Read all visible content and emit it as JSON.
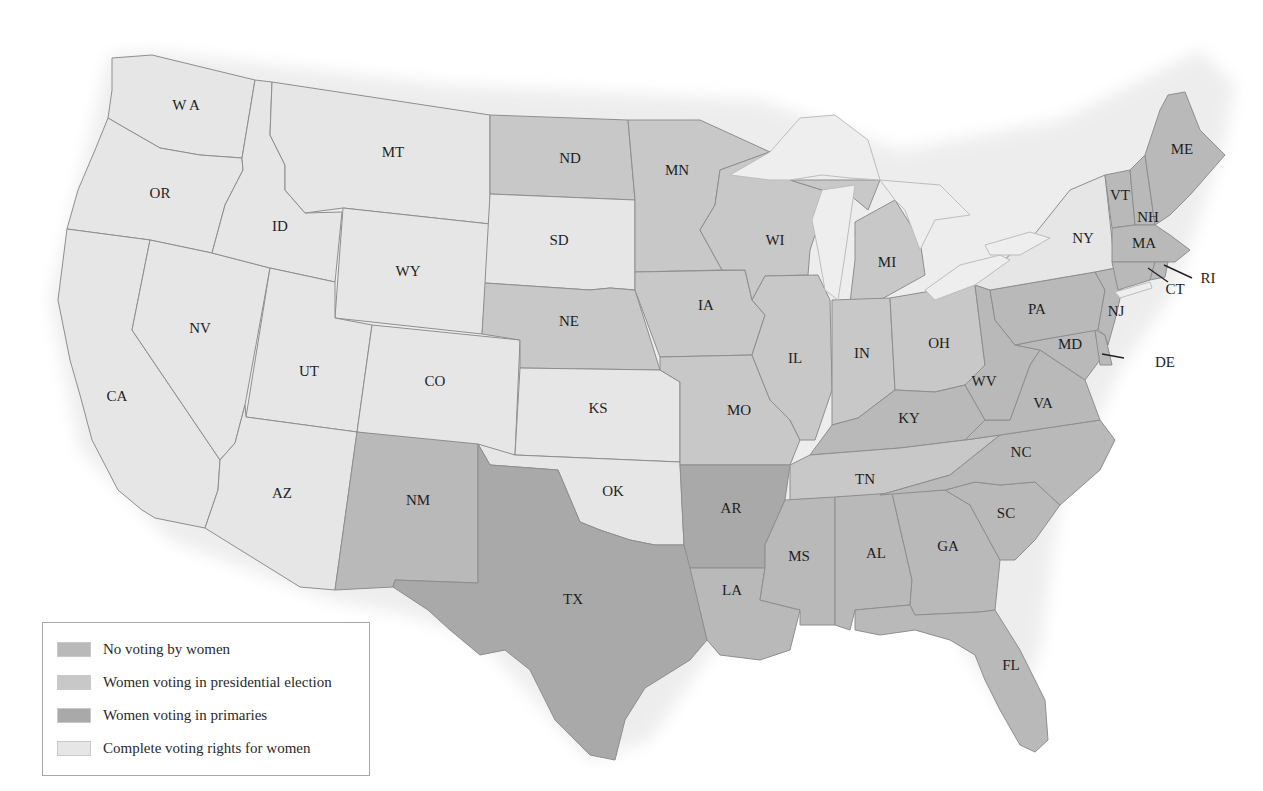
{
  "map": {
    "title": "",
    "categories": {
      "none": {
        "label": "No voting by women",
        "color": "#b9b9b9"
      },
      "presidential": {
        "label": "Women voting in presidential election",
        "color": "#c8c8c8"
      },
      "primaries": {
        "label": "Women voting in primaries",
        "color": "#a9a9a9"
      },
      "complete": {
        "label": "Complete voting rights for women",
        "color": "#e6e6e6"
      }
    },
    "legend": [
      {
        "key": "none",
        "label": "No voting by women",
        "color": "#b9b9b9"
      },
      {
        "key": "presidential",
        "label": "Women voting in presidential election",
        "color": "#c8c8c8"
      },
      {
        "key": "primaries",
        "label": "Women voting in primaries",
        "color": "#a9a9a9"
      },
      {
        "key": "complete",
        "label": "Complete voting rights for women",
        "color": "#e6e6e6"
      }
    ],
    "water_color": "#ececec",
    "states": [
      {
        "abbr": "WA",
        "label": "W A",
        "status": "complete",
        "label_xy": [
          186,
          107
        ]
      },
      {
        "abbr": "OR",
        "label": "OR",
        "status": "complete",
        "label_xy": [
          160,
          195
        ]
      },
      {
        "abbr": "CA",
        "label": "CA",
        "status": "complete",
        "label_xy": [
          117,
          398
        ]
      },
      {
        "abbr": "NV",
        "label": "NV",
        "status": "complete",
        "label_xy": [
          200,
          330
        ]
      },
      {
        "abbr": "ID",
        "label": "ID",
        "status": "complete",
        "label_xy": [
          280,
          228
        ]
      },
      {
        "abbr": "MT",
        "label": "MT",
        "status": "complete",
        "label_xy": [
          393,
          154
        ]
      },
      {
        "abbr": "WY",
        "label": "WY",
        "status": "complete",
        "label_xy": [
          408,
          273
        ]
      },
      {
        "abbr": "UT",
        "label": "UT",
        "status": "complete",
        "label_xy": [
          309,
          373
        ]
      },
      {
        "abbr": "CO",
        "label": "CO",
        "status": "complete",
        "label_xy": [
          435,
          383
        ]
      },
      {
        "abbr": "AZ",
        "label": "AZ",
        "status": "complete",
        "label_xy": [
          282,
          495
        ]
      },
      {
        "abbr": "NM",
        "label": "NM",
        "status": "none",
        "label_xy": [
          418,
          502
        ]
      },
      {
        "abbr": "ND",
        "label": "ND",
        "status": "presidential",
        "label_xy": [
          570,
          160
        ]
      },
      {
        "abbr": "SD",
        "label": "SD",
        "status": "complete",
        "label_xy": [
          559,
          242
        ]
      },
      {
        "abbr": "NE",
        "label": "NE",
        "status": "presidential",
        "label_xy": [
          569,
          323
        ]
      },
      {
        "abbr": "KS",
        "label": "KS",
        "status": "complete",
        "label_xy": [
          598,
          410
        ]
      },
      {
        "abbr": "OK",
        "label": "OK",
        "status": "complete",
        "label_xy": [
          613,
          493
        ]
      },
      {
        "abbr": "TX",
        "label": "TX",
        "status": "primaries",
        "label_xy": [
          573,
          601
        ]
      },
      {
        "abbr": "MN",
        "label": "MN",
        "status": "presidential",
        "label_xy": [
          677,
          172
        ]
      },
      {
        "abbr": "IA",
        "label": "IA",
        "status": "presidential",
        "label_xy": [
          706,
          307
        ]
      },
      {
        "abbr": "MO",
        "label": "MO",
        "status": "presidential",
        "label_xy": [
          739,
          412
        ]
      },
      {
        "abbr": "AR",
        "label": "AR",
        "status": "primaries",
        "label_xy": [
          731,
          510
        ]
      },
      {
        "abbr": "LA",
        "label": "LA",
        "status": "none",
        "label_xy": [
          732,
          592
        ]
      },
      {
        "abbr": "WI",
        "label": "WI",
        "status": "presidential",
        "label_xy": [
          775,
          242
        ]
      },
      {
        "abbr": "IL",
        "label": "IL",
        "status": "presidential",
        "label_xy": [
          795,
          360
        ]
      },
      {
        "abbr": "MI",
        "label": "MI",
        "status": "presidential",
        "label_xy": [
          887,
          264
        ]
      },
      {
        "abbr": "IN",
        "label": "IN",
        "status": "presidential",
        "label_xy": [
          862,
          355
        ]
      },
      {
        "abbr": "OH",
        "label": "OH",
        "status": "presidential",
        "label_xy": [
          939,
          345
        ]
      },
      {
        "abbr": "KY",
        "label": "KY",
        "status": "none",
        "label_xy": [
          909,
          420
        ]
      },
      {
        "abbr": "TN",
        "label": "TN",
        "status": "presidential",
        "label_xy": [
          865,
          481
        ]
      },
      {
        "abbr": "MS",
        "label": "MS",
        "status": "none",
        "label_xy": [
          799,
          558
        ]
      },
      {
        "abbr": "AL",
        "label": "AL",
        "status": "none",
        "label_xy": [
          876,
          555
        ]
      },
      {
        "abbr": "GA",
        "label": "GA",
        "status": "none",
        "label_xy": [
          948,
          548
        ]
      },
      {
        "abbr": "FL",
        "label": "FL",
        "status": "none",
        "label_xy": [
          1011,
          667
        ]
      },
      {
        "abbr": "SC",
        "label": "SC",
        "status": "none",
        "label_xy": [
          1006,
          515
        ]
      },
      {
        "abbr": "NC",
        "label": "NC",
        "status": "none",
        "label_xy": [
          1021,
          454
        ]
      },
      {
        "abbr": "VA",
        "label": "VA",
        "status": "none",
        "label_xy": [
          1043,
          405
        ]
      },
      {
        "abbr": "WV",
        "label": "WV",
        "status": "none",
        "label_xy": [
          984,
          383
        ]
      },
      {
        "abbr": "PA",
        "label": "PA",
        "status": "none",
        "label_xy": [
          1037,
          311
        ]
      },
      {
        "abbr": "MD",
        "label": "MD",
        "status": "none",
        "label_xy": [
          1070,
          346
        ]
      },
      {
        "abbr": "NJ",
        "label": "NJ",
        "status": "none",
        "label_xy": [
          1116,
          313
        ]
      },
      {
        "abbr": "DE",
        "label": "DE",
        "status": "none",
        "label_xy": [
          1165,
          364
        ]
      },
      {
        "abbr": "NY",
        "label": "NY",
        "status": "complete",
        "label_xy": [
          1083,
          240
        ]
      },
      {
        "abbr": "VT",
        "label": "VT",
        "status": "none",
        "label_xy": [
          1120,
          197
        ]
      },
      {
        "abbr": "NH",
        "label": "NH",
        "status": "none",
        "label_xy": [
          1148,
          219
        ]
      },
      {
        "abbr": "MA",
        "label": "MA",
        "status": "none",
        "label_xy": [
          1144,
          245
        ]
      },
      {
        "abbr": "CT",
        "label": "CT",
        "status": "none",
        "label_xy": [
          1175,
          291
        ]
      },
      {
        "abbr": "RI",
        "label": "RI",
        "status": "none",
        "label_xy": [
          1208,
          280
        ]
      },
      {
        "abbr": "ME",
        "label": "ME",
        "status": "none",
        "label_xy": [
          1182,
          151
        ]
      }
    ]
  }
}
